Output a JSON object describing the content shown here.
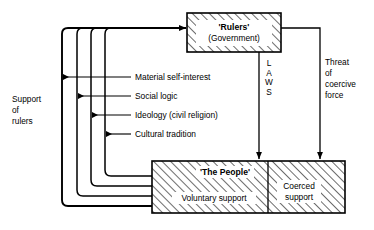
{
  "diagram": {
    "colors": {
      "line": "#000000",
      "background": "#ffffff",
      "hatch": "#000000"
    },
    "boxes": {
      "rulers": {
        "title": "'Rulers'",
        "subtitle": "(Government)",
        "fill": "hatched"
      },
      "people": {
        "title": "'The People'",
        "voluntary": "Voluntary support",
        "coerced_line1": "Coerced",
        "coerced_line2": "support",
        "fill": "hatched"
      }
    },
    "left_label": {
      "line1": "Support",
      "line2": "of",
      "line3": "rulers"
    },
    "support_channels": [
      {
        "label": "Material self-interest"
      },
      {
        "label": "Social logic"
      },
      {
        "label": "Ideology (civil religion)"
      },
      {
        "label": "Cultural tradition"
      }
    ],
    "laws_label": {
      "letters": [
        "L",
        "A",
        "W",
        "S"
      ],
      "text": "LAWS"
    },
    "threat_label": {
      "line1": "Threat",
      "line2": "of",
      "line3": "coercive",
      "line4": "force"
    }
  }
}
